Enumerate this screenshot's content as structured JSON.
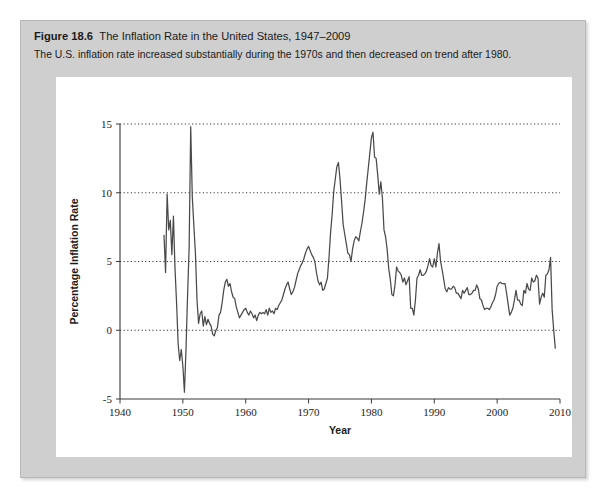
{
  "figure": {
    "number_label": "Figure 18.6",
    "title": "The Inflation Rate in the United States, 1947–2009",
    "subtitle": "The U.S. inflation rate increased substantially during the 1970s and then decreased on trend after 1980."
  },
  "colors": {
    "card_background": "#cfcfcf",
    "plot_background": "#ffffff",
    "line": "#4a4a4a",
    "axis": "#3a3a3a",
    "text": "#1b1b1b"
  },
  "chart_data": {
    "type": "line",
    "title": "The Inflation Rate in the United States, 1947–2009",
    "xlabel": "Year",
    "ylabel": "Percentage Inflation Rate",
    "xlim": [
      1940,
      2010
    ],
    "ylim": [
      -5,
      15
    ],
    "xticks": [
      1940,
      1950,
      1960,
      1970,
      1980,
      1990,
      2000,
      2010
    ],
    "xtick_labels": [
      "1940",
      "1950",
      "1960",
      "1970",
      "1980",
      "1990",
      "2000",
      "2010"
    ],
    "yticks": [
      -5,
      0,
      5,
      10,
      15
    ],
    "ytick_labels": [
      "-5",
      "0",
      "5",
      "10",
      "15"
    ],
    "grid": "horizontal-dotted",
    "legend": null,
    "series": [
      {
        "name": "Percentage Inflation Rate",
        "color": "#4a4a4a",
        "x": [
          1947.0,
          1947.25,
          1947.5,
          1947.75,
          1948.0,
          1948.25,
          1948.5,
          1948.75,
          1949.0,
          1949.25,
          1949.5,
          1949.75,
          1950.0,
          1950.25,
          1950.5,
          1950.75,
          1951.0,
          1951.25,
          1951.5,
          1951.75,
          1952.0,
          1952.25,
          1952.5,
          1952.75,
          1953.0,
          1953.25,
          1953.5,
          1953.75,
          1954.0,
          1954.25,
          1954.5,
          1954.75,
          1955.0,
          1955.25,
          1955.5,
          1955.75,
          1956.0,
          1956.25,
          1956.5,
          1956.75,
          1957.0,
          1957.25,
          1957.5,
          1957.75,
          1958.0,
          1958.25,
          1958.5,
          1958.75,
          1959.0,
          1959.25,
          1959.5,
          1959.75,
          1960.0,
          1960.25,
          1960.5,
          1960.75,
          1961.0,
          1961.25,
          1961.5,
          1961.75,
          1962.0,
          1962.25,
          1962.5,
          1962.75,
          1963.0,
          1963.25,
          1963.5,
          1963.75,
          1964.0,
          1964.25,
          1964.5,
          1964.75,
          1965.0,
          1965.25,
          1965.5,
          1965.75,
          1966.0,
          1966.25,
          1966.5,
          1966.75,
          1967.0,
          1967.25,
          1967.5,
          1967.75,
          1968.0,
          1968.25,
          1968.5,
          1968.75,
          1969.0,
          1969.25,
          1969.5,
          1969.75,
          1970.0,
          1970.25,
          1970.5,
          1970.75,
          1971.0,
          1971.25,
          1971.5,
          1971.75,
          1972.0,
          1972.25,
          1972.5,
          1972.75,
          1973.0,
          1973.25,
          1973.5,
          1973.75,
          1974.0,
          1974.25,
          1974.5,
          1974.75,
          1975.0,
          1975.25,
          1975.5,
          1975.75,
          1976.0,
          1976.25,
          1976.5,
          1976.75,
          1977.0,
          1977.25,
          1977.5,
          1977.75,
          1978.0,
          1978.25,
          1978.5,
          1978.75,
          1979.0,
          1979.25,
          1979.5,
          1979.75,
          1980.0,
          1980.25,
          1980.5,
          1980.75,
          1981.0,
          1981.25,
          1981.5,
          1981.75,
          1982.0,
          1982.25,
          1982.5,
          1982.75,
          1983.0,
          1983.25,
          1983.5,
          1983.75,
          1984.0,
          1984.25,
          1984.5,
          1984.75,
          1985.0,
          1985.25,
          1985.5,
          1985.75,
          1986.0,
          1986.25,
          1986.5,
          1986.75,
          1987.0,
          1987.25,
          1987.5,
          1987.75,
          1988.0,
          1988.25,
          1988.5,
          1988.75,
          1989.0,
          1989.25,
          1989.5,
          1989.75,
          1990.0,
          1990.25,
          1990.5,
          1990.75,
          1991.0,
          1991.25,
          1991.5,
          1991.75,
          1992.0,
          1992.25,
          1992.5,
          1992.75,
          1993.0,
          1993.25,
          1993.5,
          1993.75,
          1994.0,
          1994.25,
          1994.5,
          1994.75,
          1995.0,
          1995.25,
          1995.5,
          1995.75,
          1996.0,
          1996.25,
          1996.5,
          1996.75,
          1997.0,
          1997.25,
          1997.5,
          1997.75,
          1998.0,
          1998.25,
          1998.5,
          1998.75,
          1999.0,
          1999.25,
          1999.5,
          1999.75,
          2000.0,
          2000.25,
          2000.5,
          2000.75,
          2001.0,
          2001.25,
          2001.5,
          2001.75,
          2002.0,
          2002.25,
          2002.5,
          2002.75,
          2003.0,
          2003.25,
          2003.5,
          2003.75,
          2004.0,
          2004.25,
          2004.5,
          2004.75,
          2005.0,
          2005.25,
          2005.5,
          2005.75,
          2006.0,
          2006.25,
          2006.5,
          2006.75,
          2007.0,
          2007.25,
          2007.5,
          2007.75,
          2008.0,
          2008.25,
          2008.5,
          2008.75,
          2009.0,
          2009.25
        ],
        "values": [
          6.9,
          4.2,
          9.9,
          7.3,
          8.0,
          5.5,
          8.3,
          4.5,
          2.0,
          -1.0,
          -2.2,
          -1.4,
          -2.6,
          -4.5,
          -1.4,
          2.5,
          6.0,
          14.8,
          9.7,
          7.6,
          5.6,
          2.2,
          0.5,
          1.2,
          1.4,
          0.3,
          1.0,
          0.4,
          0.8,
          0.5,
          0.3,
          -0.3,
          -0.4,
          0.0,
          0.2,
          1.1,
          1.3,
          2.0,
          2.9,
          3.5,
          3.7,
          3.2,
          3.4,
          2.8,
          2.4,
          2.3,
          1.7,
          1.3,
          0.9,
          1.1,
          1.3,
          1.5,
          1.6,
          1.3,
          1.1,
          1.4,
          1.2,
          0.9,
          1.1,
          0.7,
          1.1,
          1.3,
          1.2,
          1.3,
          1.2,
          1.5,
          1.1,
          1.6,
          1.3,
          1.4,
          1.2,
          1.6,
          1.5,
          1.8,
          2.0,
          2.2,
          2.6,
          3.0,
          3.3,
          3.5,
          3.0,
          2.6,
          2.8,
          3.1,
          3.6,
          4.1,
          4.4,
          4.7,
          4.9,
          5.2,
          5.6,
          5.9,
          6.1,
          5.8,
          5.5,
          5.3,
          5.0,
          4.2,
          3.6,
          3.3,
          3.5,
          2.9,
          3.0,
          3.4,
          3.8,
          5.3,
          7.1,
          8.4,
          10.1,
          11.0,
          11.9,
          12.2,
          11.0,
          9.4,
          7.7,
          7.0,
          6.3,
          5.6,
          5.5,
          5.0,
          5.9,
          6.5,
          6.8,
          6.7,
          6.5,
          7.2,
          7.8,
          8.6,
          9.5,
          10.7,
          11.8,
          12.9,
          14.0,
          14.4,
          12.6,
          12.5,
          11.3,
          9.9,
          10.8,
          9.6,
          7.3,
          6.8,
          5.9,
          4.5,
          3.7,
          2.6,
          2.5,
          3.3,
          4.6,
          4.3,
          4.2,
          4.0,
          3.5,
          3.8,
          3.3,
          3.6,
          3.9,
          1.6,
          1.6,
          1.1,
          2.2,
          3.8,
          4.0,
          4.4,
          4.0,
          4.0,
          4.1,
          4.3,
          4.7,
          5.2,
          4.7,
          4.6,
          5.2,
          4.6,
          5.6,
          6.3,
          5.0,
          4.4,
          3.7,
          3.0,
          2.8,
          3.1,
          3.0,
          3.0,
          3.2,
          3.1,
          2.7,
          2.7,
          2.5,
          2.3,
          2.9,
          2.7,
          2.9,
          3.1,
          2.6,
          2.6,
          2.7,
          2.9,
          2.9,
          3.3,
          3.0,
          2.3,
          2.2,
          1.8,
          1.5,
          1.6,
          1.6,
          1.5,
          1.7,
          2.0,
          2.2,
          2.6,
          3.2,
          3.4,
          3.5,
          3.4,
          3.4,
          3.4,
          2.7,
          1.9,
          1.1,
          1.3,
          1.6,
          2.2,
          2.9,
          2.2,
          2.2,
          1.9,
          1.8,
          2.9,
          2.7,
          3.4,
          3.0,
          2.9,
          3.8,
          3.5,
          3.6,
          4.0,
          3.8,
          1.9,
          2.4,
          2.7,
          2.4,
          4.0,
          4.1,
          4.4,
          5.3,
          1.5,
          0.0,
          -1.3
        ]
      }
    ],
    "annotations": [
      {
        "text": "Peak inflation 1951",
        "x": 1951.25,
        "y": 14.8
      },
      {
        "text": "Deflation trough 1949–1950",
        "x": 1950.25,
        "y": -4.5
      },
      {
        "text": "1974 oil shock peak",
        "x": 1974.75,
        "y": 12.2
      },
      {
        "text": "1980 peak",
        "x": 1980.25,
        "y": 14.4
      }
    ]
  }
}
